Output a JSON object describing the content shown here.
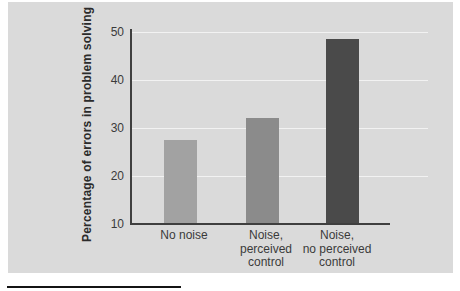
{
  "chart_data": {
    "type": "bar",
    "categories": [
      "No noise",
      "Noise, perceived control",
      "Noise, no perceived control"
    ],
    "category_lines": [
      [
        "No noise"
      ],
      [
        "Noise,",
        "perceived",
        "control"
      ],
      [
        "Noise,",
        "no perceived",
        "control"
      ]
    ],
    "values": [
      27.5,
      32,
      48.5
    ],
    "ylabel": "Percentage of errors in problem solving",
    "xlabel": "",
    "ylim": [
      10,
      50
    ],
    "yticks": [
      10,
      20,
      30,
      40,
      50
    ],
    "grid": "horizontal",
    "legend": "none",
    "bar_colors": [
      "#a2a2a2",
      "#8b8b8b",
      "#4a4a4a"
    ],
    "colors": {
      "page_bg": "#ffffff",
      "panel_bg": "#dadada",
      "axis": "#3f3f3f",
      "gridline": "#f2f2f2",
      "text": "#3a3a3a"
    }
  }
}
